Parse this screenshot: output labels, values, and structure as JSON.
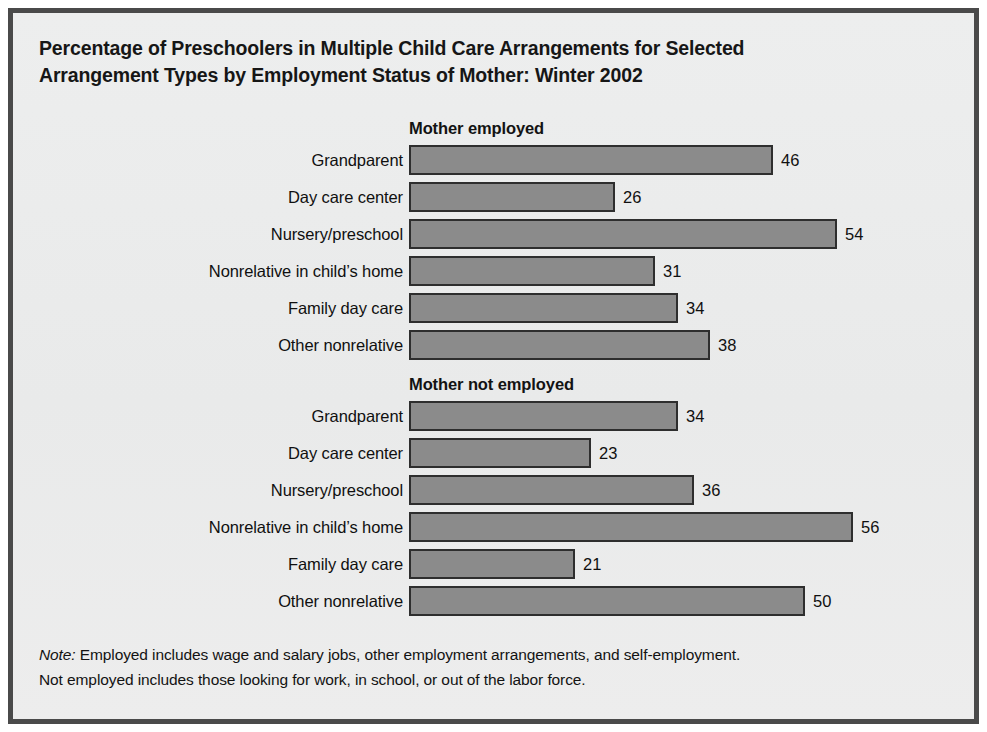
{
  "figure": {
    "title_line1": "Percentage of Preschoolers in Multiple Child Care Arrangements for Selected",
    "title_line2": "Arrangement Types by Employment Status of Mother: Winter 2002",
    "note_label": "Note:",
    "note_line1": " Employed includes wage and salary jobs, other employment arrangements, and self-employment.",
    "note_line2": "Not employed includes those looking for work, in school, or out of the labor force.",
    "colors": {
      "bar_fill": "#8b8b8b",
      "bar_border": "#2e2e2e",
      "panel_background": "#ececed",
      "frame_border": "#4a4a4a",
      "text": "#131313"
    }
  },
  "chart_data": {
    "type": "bar",
    "orientation": "horizontal",
    "title": "Percentage of Preschoolers in Multiple Child Care Arrangements for Selected Arrangement Types by Employment Status of Mother: Winter 2002",
    "xlabel": "",
    "ylabel": "",
    "xlim": [
      0,
      60
    ],
    "grid": false,
    "legend": "none",
    "value_labels": true,
    "categories": [
      "Grandparent",
      "Day care center",
      "Nursery/preschool",
      "Nonrelative in child’s home",
      "Family day care",
      "Other nonrelative"
    ],
    "series": [
      {
        "name": "Mother employed",
        "values": [
          46,
          26,
          54,
          31,
          34,
          38
        ]
      },
      {
        "name": "Mother not employed",
        "values": [
          34,
          23,
          36,
          56,
          21,
          50
        ]
      }
    ]
  }
}
